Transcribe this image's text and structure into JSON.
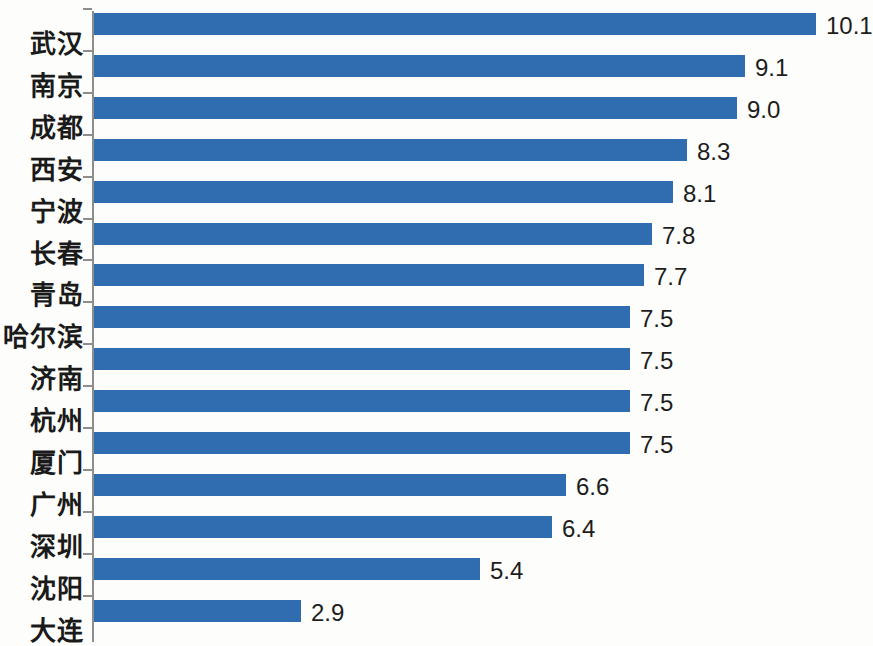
{
  "chart_data": {
    "type": "bar",
    "orientation": "horizontal",
    "title": "",
    "subtitle": "",
    "xlabel": "",
    "ylabel": "",
    "grid": false,
    "legend": null,
    "xlim": [
      0,
      10.9
    ],
    "categories": [
      "武汉",
      "南京",
      "成都",
      "西安",
      "宁波",
      "长春",
      "青岛",
      "哈尔滨",
      "济南",
      "杭州",
      "厦门",
      "广州",
      "深圳",
      "沈阳",
      "大连"
    ],
    "values": [
      10.1,
      9.1,
      9.0,
      8.3,
      8.1,
      7.8,
      7.7,
      7.5,
      7.5,
      7.5,
      7.5,
      6.6,
      6.4,
      5.4,
      2.9
    ],
    "value_labels": [
      "10.1",
      "9.1",
      "9.0",
      "8.3",
      "8.1",
      "7.8",
      "7.7",
      "7.5",
      "7.5",
      "7.5",
      "7.5",
      "6.6",
      "6.4",
      "5.4",
      "2.9"
    ],
    "bar_color": "#2f6cb0",
    "axis_color": "#8d8d8d",
    "background_color": "#fdfdfb",
    "label_color": "#1a1a1a"
  }
}
